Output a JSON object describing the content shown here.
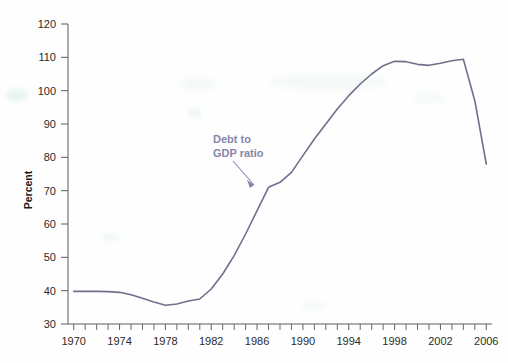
{
  "chart_data": {
    "type": "line",
    "title": "",
    "subtitle": "",
    "xlabel": "",
    "ylabel": "Percent",
    "xlim": [
      1969.5,
      2006.5
    ],
    "ylim": [
      30,
      120
    ],
    "grid": false,
    "legend_position": "none",
    "annotations": [
      {
        "name": "series-callout",
        "text_line1": "Debt to",
        "text_line2": "GDP ratio",
        "color": "#8585a8",
        "points_to_year": 1986,
        "points_to_value": 71
      }
    ],
    "axis": {
      "y_ticks": [
        30,
        40,
        50,
        60,
        70,
        80,
        90,
        100,
        110,
        120
      ],
      "y_tick_labels": [
        "30",
        "40",
        "50",
        "60",
        "70",
        "80",
        "90",
        "100",
        "110",
        "120"
      ],
      "x_ticks": [
        1970,
        1971,
        1972,
        1973,
        1974,
        1975,
        1976,
        1977,
        1978,
        1979,
        1980,
        1981,
        1982,
        1983,
        1984,
        1985,
        1986,
        1987,
        1988,
        1989,
        1990,
        1991,
        1992,
        1993,
        1994,
        1995,
        1996,
        1997,
        1998,
        1999,
        2000,
        2001,
        2002,
        2003,
        2004,
        2005,
        2006
      ],
      "x_tick_labels": [
        "1970",
        "1974",
        "1978",
        "1982",
        "1986",
        "1990",
        "1994",
        "1998",
        "2002",
        "2006"
      ],
      "x_labeled_ticks": [
        1970,
        1974,
        1978,
        1982,
        1986,
        1990,
        1994,
        1998,
        2002,
        2006
      ],
      "axis_color": "#5d5d5d"
    },
    "series": [
      {
        "name": "Debt to GDP ratio",
        "color": "#6f6f8c",
        "x": [
          1970,
          1971,
          1972,
          1973,
          1974,
          1975,
          1976,
          1977,
          1978,
          1979,
          1980,
          1981,
          1982,
          1983,
          1984,
          1985,
          1986,
          1987,
          1988,
          1989,
          1990,
          1991,
          1992,
          1993,
          1994,
          1995,
          1996,
          1997,
          1998,
          1999,
          2000,
          2001,
          2002,
          2003,
          2004,
          2005,
          2006
        ],
        "values": [
          39.8,
          39.8,
          39.8,
          39.7,
          39.5,
          38.8,
          37.7,
          36.6,
          35.6,
          36.0,
          36.9,
          37.5,
          40.5,
          45.0,
          50.5,
          57.0,
          64.0,
          71.0,
          72.5,
          75.5,
          80.5,
          85.5,
          90.0,
          94.5,
          98.5,
          102.0,
          105.0,
          107.5,
          108.8,
          108.7,
          107.9,
          107.6,
          108.2,
          109.0,
          109.4,
          97.0,
          78.0
        ]
      }
    ]
  }
}
